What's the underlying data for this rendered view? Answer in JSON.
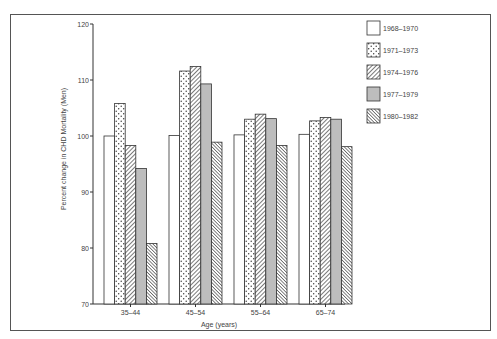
{
  "chart_data": {
    "type": "bar",
    "title": "",
    "xlabel": "Age (years)",
    "ylabel": "Percent change in CHD Mortality (Men)",
    "ylim": [
      70,
      120
    ],
    "yticks": [
      70,
      80,
      90,
      100,
      110,
      120
    ],
    "grid": false,
    "legend_position": "right",
    "categories": [
      "35–44",
      "45–54",
      "55–64",
      "65–74"
    ],
    "series": [
      {
        "name": "1968–1970",
        "pattern": "white",
        "values": [
          100.0,
          100.1,
          100.2,
          100.3
        ]
      },
      {
        "name": "1971–1973",
        "pattern": "dotted",
        "values": [
          105.8,
          111.6,
          103.0,
          102.7
        ]
      },
      {
        "name": "1974–1976",
        "pattern": "diagonal-hatch",
        "values": [
          98.3,
          112.4,
          103.9,
          103.3
        ]
      },
      {
        "name": "1977–1979",
        "pattern": "gray",
        "values": [
          94.2,
          109.3,
          103.1,
          103.0
        ]
      },
      {
        "name": "1980–1982",
        "pattern": "dense-diagonal-hatch",
        "values": [
          80.8,
          98.9,
          98.3,
          98.1
        ]
      }
    ]
  },
  "colors": {
    "frame": "#555555",
    "bar_outline": "#333333",
    "gray_fill": "#bdbdbd",
    "text": "#444444"
  }
}
